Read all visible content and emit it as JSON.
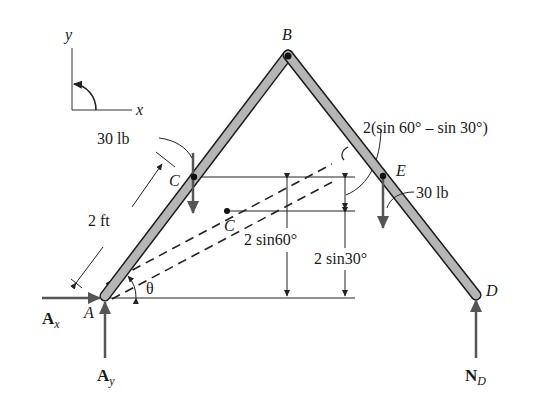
{
  "diagram": {
    "type": "free-body-diagram",
    "axes": {
      "x_label": "x",
      "y_label": "y",
      "rotation_icon": "counterclockwise-arrow-icon"
    },
    "points": {
      "A": {
        "label": "A"
      },
      "B": {
        "label": "B"
      },
      "C_member": {
        "label": "C"
      },
      "C_centroid": {
        "label": "C"
      },
      "D": {
        "label": "D"
      },
      "E": {
        "label": "E"
      }
    },
    "loads": {
      "left": {
        "label": "30 lb"
      },
      "right": {
        "label": "30 lb"
      }
    },
    "reactions": {
      "Ax": {
        "main": "A",
        "sub": "x"
      },
      "Ay": {
        "main": "A",
        "sub": "y"
      },
      "ND": {
        "main": "N",
        "sub": "D"
      }
    },
    "dimensions": {
      "length": "2 ft",
      "angle": "θ",
      "height_60": "2 sin60°",
      "height_30": "2 sin30°",
      "difference": "2(sin 60° – sin 30°)"
    },
    "colors": {
      "member_fill": "#b5b5b5",
      "member_stroke": "#1a1a1a",
      "force_arrow": "#555555",
      "line": "#222222"
    }
  }
}
